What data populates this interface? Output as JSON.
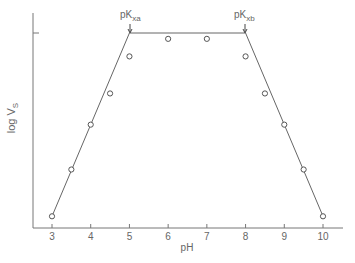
{
  "chart_data": {
    "type": "line",
    "title": "",
    "xlabel": "pH",
    "ylabel": "log V",
    "ylabel_subscript": "S",
    "xlim": [
      2.5,
      10.5
    ],
    "ylim": [
      0,
      1.1
    ],
    "grid": false,
    "legend": null,
    "x_ticks": [
      3,
      4,
      5,
      6,
      7,
      8,
      9,
      10
    ],
    "x_tick_labels": [
      "3",
      "4",
      "5",
      "6",
      "7",
      "8",
      "9",
      "10"
    ],
    "y_ticks": [
      1.0
    ],
    "y_tick_labels": [
      ""
    ],
    "series": [
      {
        "name": "model (trapezoid)",
        "style": "line",
        "x": [
          3,
          5,
          8,
          10
        ],
        "y": [
          0.06,
          1.0,
          1.0,
          0.06
        ]
      },
      {
        "name": "measured",
        "style": "open-circle",
        "x": [
          3,
          3.5,
          4,
          4.5,
          5,
          6,
          7,
          8,
          8.5,
          9,
          9.5,
          10
        ],
        "y": [
          0.06,
          0.3,
          0.53,
          0.69,
          0.88,
          0.97,
          0.97,
          0.88,
          0.69,
          0.53,
          0.3,
          0.06
        ]
      }
    ],
    "annotations": [
      {
        "text": "pK",
        "subscript": "xa",
        "x": 5,
        "y": 1.0,
        "marker": "arrow-down"
      },
      {
        "text": "pK",
        "subscript": "xb",
        "x": 8,
        "y": 1.0,
        "marker": "arrow-down"
      }
    ]
  },
  "labels": {
    "xlabel": "pH",
    "ylabel_main": "log V",
    "ylabel_sub": "S",
    "pka_main": "pK",
    "pka_sub": "xa",
    "pkb_main": "pK",
    "pkb_sub": "xb",
    "ticks": [
      "3",
      "4",
      "5",
      "6",
      "7",
      "8",
      "9",
      "10"
    ]
  },
  "colors": {
    "axis": "#777777",
    "line": "#666666",
    "marker": "#555555",
    "text": "#666666"
  }
}
